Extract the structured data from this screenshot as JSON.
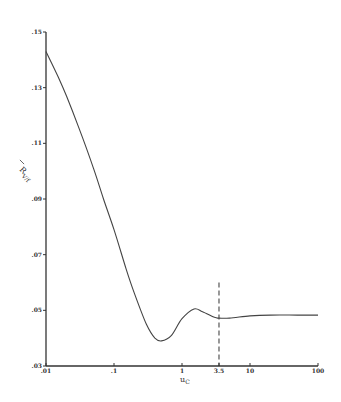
{
  "chart_data": {
    "type": "line",
    "title": "",
    "xlabel": "u_c",
    "ylabel": "R̄_{V/f}",
    "xscale": "log",
    "xlim": [
      0.01,
      100
    ],
    "ylim": [
      0.03,
      0.15
    ],
    "grid": false,
    "x_ticks": [
      {
        "value": 0.01,
        "label": ".01"
      },
      {
        "value": 0.1,
        "label": ".1"
      },
      {
        "value": 1,
        "label": "1"
      },
      {
        "value": 3.5,
        "label": "3.5"
      },
      {
        "value": 10,
        "label": "10"
      },
      {
        "value": 100,
        "label": "100"
      }
    ],
    "y_ticks": [
      {
        "value": 0.15,
        "label": ".15"
      },
      {
        "value": 0.13,
        "label": ".13"
      },
      {
        "value": 0.11,
        "label": ".11"
      },
      {
        "value": 0.09,
        "label": ".09"
      },
      {
        "value": 0.07,
        "label": ".07"
      },
      {
        "value": 0.05,
        "label": ".05"
      },
      {
        "value": 0.03,
        "label": ".03"
      }
    ],
    "series": [
      {
        "name": "R_V/f",
        "x": [
          0.01,
          0.015,
          0.02,
          0.03,
          0.05,
          0.07,
          0.1,
          0.15,
          0.2,
          0.3,
          0.4,
          0.5,
          0.7,
          1.0,
          1.5,
          2.0,
          3.0,
          3.5,
          5,
          10,
          20,
          50,
          100
        ],
        "values": [
          0.143,
          0.134,
          0.127,
          0.116,
          0.101,
          0.09,
          0.079,
          0.065,
          0.056,
          0.045,
          0.04,
          0.039,
          0.041,
          0.047,
          0.0505,
          0.0495,
          0.0475,
          0.0472,
          0.0472,
          0.048,
          0.0483,
          0.0483,
          0.0483
        ]
      }
    ],
    "annotations": [
      {
        "type": "vline",
        "x": 3.5,
        "style": "dashed",
        "y_from": 0.03,
        "y_to": 0.06
      }
    ]
  },
  "axes": {
    "xlabel_text": "u",
    "xlabel_sub": "C",
    "ylabel_text": "R",
    "ylabel_sub": "V/f"
  }
}
